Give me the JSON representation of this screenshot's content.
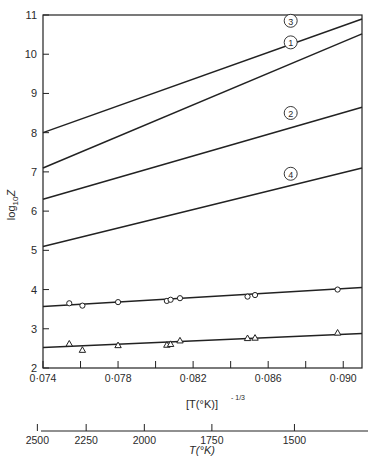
{
  "chart_data": {
    "type": "line",
    "title": "",
    "xlabel": "[T(°K)]^(-1/3)",
    "ylabel": "log10 Z",
    "xlim": [
      0.074,
      0.091
    ],
    "ylim": [
      2,
      11
    ],
    "grid": false,
    "x_ticks": [
      0.074,
      0.076,
      0.078,
      0.08,
      0.082,
      0.084,
      0.086,
      0.088,
      0.09
    ],
    "x_tick_labels": [
      "0·074",
      "",
      "0·078",
      "",
      "0·082",
      "",
      "0·086",
      "",
      "0·090"
    ],
    "y_ticks": [
      2,
      3,
      4,
      5,
      6,
      7,
      8,
      9,
      10,
      11
    ],
    "y_tick_labels": [
      "2",
      "3",
      "4",
      "5",
      "6",
      "7",
      "8",
      "9",
      "10",
      "11"
    ],
    "secondary_x_axis": {
      "label": "T(°K)",
      "ticks": [
        {
          "label": "2500",
          "x_equiv": 0.0737
        },
        {
          "label": "2250",
          "x_equiv": 0.0763
        },
        {
          "label": "2000",
          "x_equiv": 0.0794
        },
        {
          "label": "1750",
          "x_equiv": 0.083
        },
        {
          "label": "1500",
          "x_equiv": 0.0874
        }
      ]
    },
    "series": [
      {
        "name": "3",
        "label": "③",
        "marker": "none",
        "x": [
          0.074,
          0.091
        ],
        "y": [
          8.0,
          10.9
        ],
        "label_pos": [
          0.0872,
          10.75
        ]
      },
      {
        "name": "1",
        "label": "①",
        "marker": "none",
        "x": [
          0.074,
          0.091
        ],
        "y": [
          7.1,
          10.52
        ],
        "label_pos": [
          0.0872,
          10.2
        ]
      },
      {
        "name": "2",
        "label": "②",
        "marker": "none",
        "x": [
          0.074,
          0.091
        ],
        "y": [
          6.3,
          8.65
        ],
        "label_pos": [
          0.0872,
          8.4
        ]
      },
      {
        "name": "4",
        "label": "④",
        "marker": "none",
        "x": [
          0.074,
          0.091
        ],
        "y": [
          5.1,
          7.1
        ],
        "label_pos": [
          0.0872,
          6.85
        ]
      },
      {
        "name": "circles",
        "label": "",
        "marker": "circle",
        "fit": {
          "x": [
            0.074,
            0.091
          ],
          "y": [
            3.57,
            4.05
          ]
        },
        "x": [
          0.0754,
          0.0761,
          0.078,
          0.0806,
          0.0808,
          0.0813,
          0.0849,
          0.0853,
          0.0897
        ],
        "y": [
          3.65,
          3.59,
          3.68,
          3.71,
          3.74,
          3.78,
          3.82,
          3.86,
          4.0
        ]
      },
      {
        "name": "triangles",
        "label": "",
        "marker": "triangle",
        "fit": {
          "x": [
            0.074,
            0.091
          ],
          "y": [
            2.52,
            2.88
          ]
        },
        "x": [
          0.0754,
          0.0761,
          0.078,
          0.0806,
          0.0808,
          0.0813,
          0.0849,
          0.0853,
          0.0897
        ],
        "y": [
          2.62,
          2.46,
          2.58,
          2.59,
          2.61,
          2.7,
          2.76,
          2.77,
          2.9
        ]
      }
    ]
  },
  "axes": {
    "y_label_main": "log",
    "y_label_sub": "10",
    "y_label_var": "Z",
    "x_label_main": "[T(°K)]",
    "x_label_exp": "- 1/3",
    "secondary_label": "T(°K)"
  }
}
